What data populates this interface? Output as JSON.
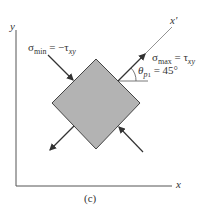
{
  "figure": {
    "caption": "(c)",
    "axes": {
      "x_label": "x",
      "y_label": "y",
      "rotated_axis_label": "x'"
    },
    "labels": {
      "sigma_min": {
        "symbol": "σ",
        "sub": "min",
        "eq": " = −τ",
        "eq_sub": "xy"
      },
      "sigma_max": {
        "symbol": "σ",
        "sub": "max",
        "eq": " = τ",
        "eq_sub": "xy"
      },
      "theta": {
        "symbol": "θ",
        "sub": "p",
        "subsub": "1",
        "eq": " = 45°"
      }
    },
    "colors": {
      "element_fill": "#b3b3b3",
      "stroke": "#333333"
    }
  }
}
